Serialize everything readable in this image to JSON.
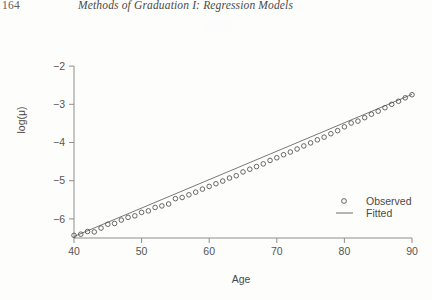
{
  "page": {
    "folio": "164",
    "running_head": "Methods of Graduation I: Regression Models"
  },
  "chart_data": {
    "type": "scatter",
    "title": "",
    "xlabel": "Age",
    "ylabel": "log(μ)",
    "xlim": [
      40,
      90
    ],
    "ylim": [
      -6.5,
      -1.5
    ],
    "xticks": [
      40,
      50,
      60,
      70,
      80,
      90
    ],
    "xtick_labels": [
      "40",
      "50",
      "60",
      "70",
      "80",
      "90"
    ],
    "yticks": [
      -2,
      -3,
      -4,
      -5,
      -6
    ],
    "ytick_labels": [
      "−2",
      "−3",
      "−4",
      "−5",
      "−6"
    ],
    "grid": false,
    "legend_position": "bottom-right",
    "legend": [
      {
        "label": "Observed",
        "marker": "open-circle"
      },
      {
        "label": "Fitted",
        "marker": "line"
      }
    ],
    "series": [
      {
        "name": "Observed",
        "marker": "open-circle",
        "x": [
          40,
          41,
          42,
          43,
          44,
          45,
          46,
          47,
          48,
          49,
          50,
          51,
          52,
          53,
          54,
          55,
          56,
          57,
          58,
          59,
          60,
          61,
          62,
          63,
          64,
          65,
          66,
          67,
          68,
          69,
          70,
          71,
          72,
          73,
          74,
          75,
          76,
          77,
          78,
          79,
          80,
          81,
          82,
          83,
          84,
          85,
          86,
          87,
          88,
          89,
          90
        ],
        "y": [
          -6.43,
          -6.4,
          -6.33,
          -6.34,
          -6.24,
          -6.14,
          -6.12,
          -6.03,
          -5.96,
          -5.92,
          -5.83,
          -5.79,
          -5.7,
          -5.66,
          -5.61,
          -5.47,
          -5.44,
          -5.37,
          -5.3,
          -5.22,
          -5.15,
          -5.08,
          -5.01,
          -4.93,
          -4.87,
          -4.77,
          -4.7,
          -4.63,
          -4.56,
          -4.47,
          -4.4,
          -4.32,
          -4.25,
          -4.17,
          -4.09,
          -4.01,
          -3.93,
          -3.86,
          -3.77,
          -3.69,
          -3.59,
          -3.49,
          -3.44,
          -3.35,
          -3.26,
          -3.18,
          -3.09,
          -3.0,
          -2.92,
          -2.83,
          -2.75
        ]
      },
      {
        "name": "Fitted",
        "marker": "line",
        "x": [
          40,
          90
        ],
        "y": [
          -6.46,
          -2.74
        ]
      }
    ]
  },
  "colors": {
    "axis": "#8e8e8e",
    "marker": "#4e4e4e",
    "fit_line": "#6a6a6a",
    "text": "#4a4a4a",
    "page_background": "#fdfdfc"
  }
}
